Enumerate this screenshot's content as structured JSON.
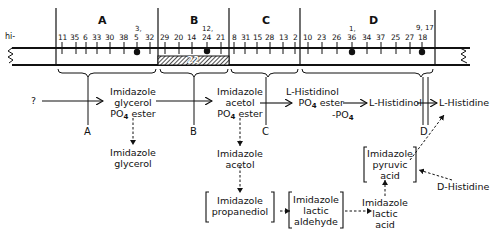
{
  "map": {
    "prefix": "hi-",
    "sections": [
      {
        "label": "A",
        "mutants": [
          "11",
          "35",
          "6",
          "33",
          "30",
          "38",
          "5",
          "32"
        ]
      },
      {
        "label": "B",
        "mutants": [
          "29",
          "20",
          "14",
          "24",
          "21"
        ]
      },
      {
        "label": "C",
        "mutants": [
          "8",
          "31",
          "15",
          "28",
          "13",
          "2"
        ]
      },
      {
        "label": "D",
        "mutants": [
          "10",
          "23",
          "26",
          "36",
          "34",
          "37",
          "25",
          "27",
          "18"
        ]
      }
    ],
    "markers": {
      "a": "3,",
      "b": "12,",
      "d1": "1,",
      "d2": "9, 17"
    },
    "deletion_label": "22"
  },
  "genes": [
    "A",
    "B",
    "C",
    "D"
  ],
  "pathway": {
    "start": "?",
    "igp": {
      "line1": "Imidazole",
      "line2": "glycerol",
      "line3": "PO",
      "sub": "4",
      "line3b": " ester"
    },
    "iap": {
      "line1": "Imidazole",
      "line2": "acetol",
      "line3": "PO",
      "sub": "4",
      "line3b": " ester"
    },
    "hp": {
      "line1": "L-Histidinol",
      "line2": "PO",
      "sub": "4",
      "line2b": " ester",
      "minus": "-PO",
      "minus_sub": "4"
    },
    "histidinol": "L-Histidinol",
    "histidine": "L-Histidine",
    "ig": {
      "line1": "Imidazole",
      "line2": "glycerol"
    },
    "ia": {
      "line1": "Imidazole",
      "line2": "acetol"
    },
    "ipd": {
      "line1": "Imidazole",
      "line2": "propanediol"
    },
    "ila": {
      "line1": "Imidazole",
      "line2": "lactic",
      "line3": "aldehyde"
    },
    "ilac": {
      "line1": "Imidazole",
      "line2": "lactic",
      "line3": "acid"
    },
    "ipa": {
      "line1": "Imidazole",
      "line2": "pyruvic",
      "line3": "acid"
    },
    "dhis": "D-Histidine"
  }
}
